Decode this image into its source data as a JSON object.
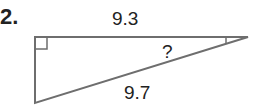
{
  "problem_number": "2.",
  "triangle": {
    "top_side_label": "9.3",
    "hypotenuse_label": "9.7",
    "unknown_angle_label": "?",
    "right_angle": "top-left",
    "line_color": "#6e6e6e"
  }
}
